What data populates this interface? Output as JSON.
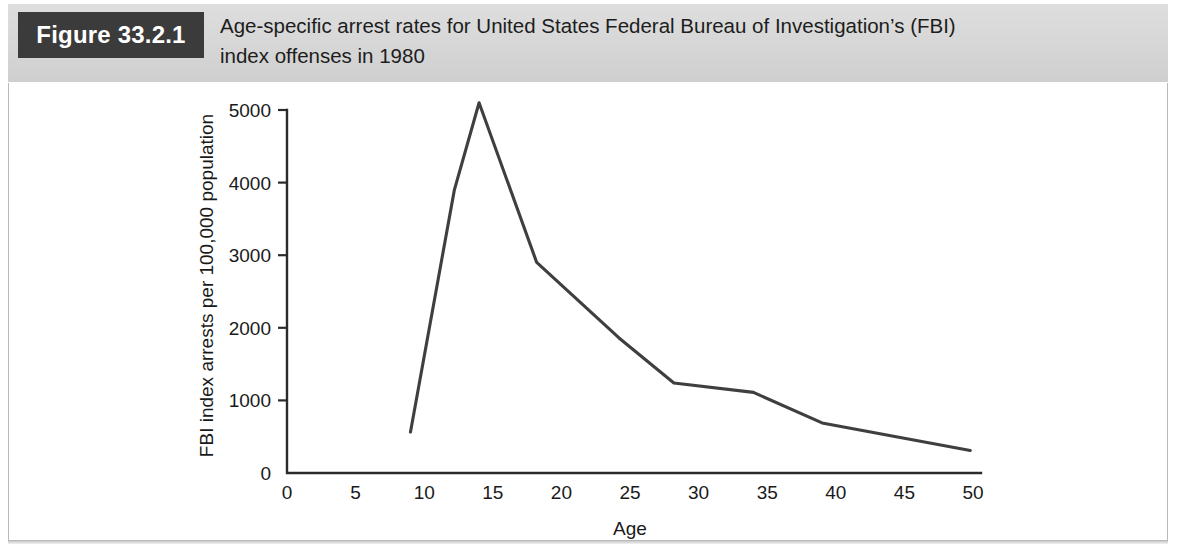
{
  "figure": {
    "badge_label": "Figure 33.2.1",
    "caption_line1": "Age-specific arrest rates for United States Federal Bureau of Investigation’s (FBI)",
    "caption_line2": "index offenses in 1980",
    "badge_bg": "#3b3b3b",
    "badge_text_color": "#ffffff",
    "header_bg": "#d6d6d6",
    "panel_bg": "#ffffff",
    "panel_border": "#b9b9b9"
  },
  "chart_data": {
    "type": "line",
    "title": "Age-specific arrest rates for United States Federal Bureau of Investigation’s (FBI) index offenses in 1980",
    "xlabel": "Age",
    "ylabel": "FBI index arrests per 100,000 population",
    "xlim": [
      0,
      50
    ],
    "ylim": [
      0,
      5000
    ],
    "xticks": [
      0,
      5,
      10,
      15,
      20,
      25,
      30,
      35,
      40,
      45,
      50
    ],
    "xtick_labels": [
      "0",
      "5",
      "10",
      "15",
      "20",
      "25",
      "30",
      "35",
      "40",
      "45",
      "50"
    ],
    "yticks": [
      0,
      1000,
      2000,
      3000,
      4000,
      5000
    ],
    "ytick_labels": [
      "0",
      "1000",
      "2000",
      "3000",
      "4000",
      "5000"
    ],
    "grid": false,
    "legend": false,
    "line_color": "#3f3f3f",
    "series": [
      {
        "name": "FBI index arrest rate",
        "x": [
          9,
          12.2,
          14,
          18.2,
          24.2,
          28.2,
          34,
          39,
          49.8
        ],
        "values": [
          565,
          3900,
          5100,
          2900,
          1860,
          1240,
          1110,
          690,
          310
        ]
      }
    ]
  }
}
